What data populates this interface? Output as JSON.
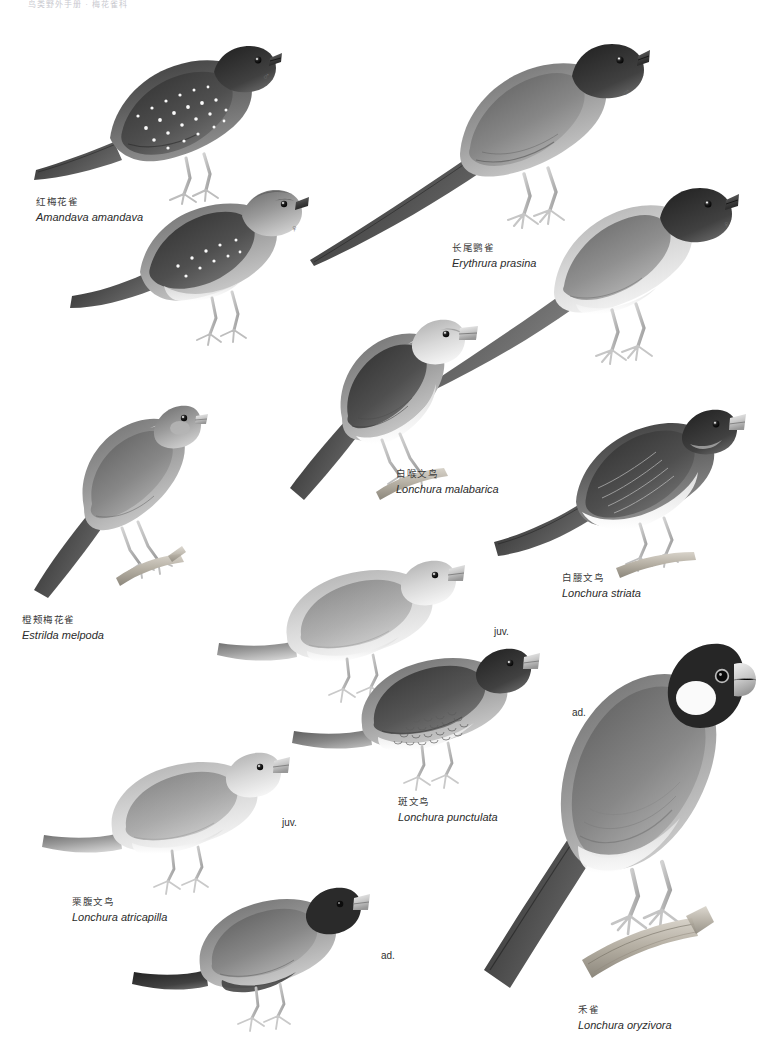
{
  "plate": {
    "running_head": "鸟类野外手册 · 梅花雀科",
    "width": 763,
    "height": 1049,
    "background": "#ffffff"
  },
  "species": [
    {
      "id": "amandava-amandava",
      "chinese_name": "红梅花雀",
      "scientific_name": "Amandava amandava",
      "caption_x": 36,
      "caption_y": 196
    },
    {
      "id": "erythrura-prasina",
      "chinese_name": "长尾鹦雀",
      "scientific_name": "Erythrura prasina",
      "caption_x": 452,
      "caption_y": 242
    },
    {
      "id": "lonchura-malabarica",
      "chinese_name": "白喉文鸟",
      "scientific_name": "Lonchura malabarica",
      "caption_x": 396,
      "caption_y": 468
    },
    {
      "id": "lonchura-striata",
      "chinese_name": "白腰文鸟",
      "scientific_name": "Lonchura striata",
      "caption_x": 562,
      "caption_y": 572
    },
    {
      "id": "estrilda-melpoda",
      "chinese_name": "橙颊梅花雀",
      "scientific_name": "Estrilda melpoda",
      "caption_x": 22,
      "caption_y": 614
    },
    {
      "id": "lonchura-punctulata",
      "chinese_name": "斑文鸟",
      "scientific_name": "Lonchura punctulata",
      "caption_x": 398,
      "caption_y": 796
    },
    {
      "id": "lonchura-atricapilla",
      "chinese_name": "栗腹文鸟",
      "scientific_name": "Lonchura atricapilla",
      "caption_x": 72,
      "caption_y": 896
    },
    {
      "id": "lonchura-oryzivora",
      "chinese_name": "禾雀",
      "scientific_name": "Lonchura oryzivora",
      "caption_x": 578,
      "caption_y": 1004
    }
  ],
  "annotations": [
    {
      "id": "amandava-male",
      "text": "♂",
      "x": 262,
      "y": 70
    },
    {
      "id": "amandava-female",
      "text": "♀",
      "x": 290,
      "y": 222
    },
    {
      "id": "prasina-male",
      "text": "♂",
      "x": 622,
      "y": 86
    },
    {
      "id": "prasina-female",
      "text": "♀",
      "x": 722,
      "y": 218
    },
    {
      "id": "punctulata-juv",
      "text": "juv.",
      "x": 494,
      "y": 626
    },
    {
      "id": "punctulata-ad",
      "text": "ad.",
      "x": 572,
      "y": 707
    },
    {
      "id": "atricapilla-juv",
      "text": "juv.",
      "x": 282,
      "y": 817
    },
    {
      "id": "atricapilla-ad",
      "text": "ad.",
      "x": 381,
      "y": 950
    }
  ],
  "palette": {
    "ink": "#2b2b2b",
    "caption_cn": "#3b3b3b",
    "annotation": "#2f2f2f",
    "plumage_dark": "#4a4a4a",
    "plumage_mid": "#8d8d8d",
    "plumage_light": "#c9c9c9",
    "plumage_pale": "#eeeeee",
    "bill_light": "#d6d6d6",
    "perch": "#b9b3a8"
  }
}
